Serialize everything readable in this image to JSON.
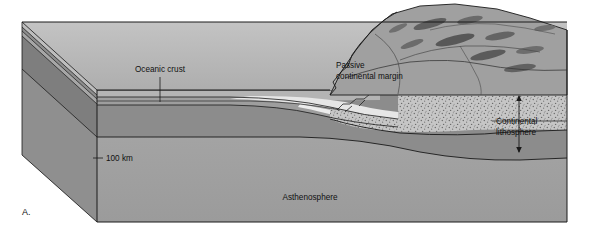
{
  "figure": {
    "panel_label": "A.",
    "type": "block-diagram"
  },
  "labels": {
    "oceanic_crust": "Oceanic crust",
    "passive_margin_line1": "Passive",
    "passive_margin_line2": "continental margin",
    "continental_lithosphere_line1": "Continental",
    "continental_lithosphere_line2": "lithosphere",
    "asthenosphere": "Asthenosphere",
    "depth_scale": "100 km"
  },
  "colors": {
    "background": "#ffffff",
    "sky_top_face": "#b9b9b9",
    "left_side_face": "#8f8f8f",
    "asthenosphere": "#a2a2a2",
    "mantle_lithosphere": "#8c8c8c",
    "continental_crust_stipple": "#c4c4c4",
    "oceanic_crust": "#9e9e9e",
    "sediment_wedge": "#e4e4e4",
    "water": "#b4b4b4",
    "mountain_terrain": "#9a9a9a",
    "mountain_shadow": "#565656",
    "outline": "#1a1a1a",
    "text": "#111111"
  },
  "geology": {
    "layers": [
      "water",
      "oceanic crust",
      "sediment wedge",
      "continental crust",
      "mantle lithosphere",
      "asthenosphere"
    ],
    "features": [
      "stair-step normal faults at margin",
      "thickening sediment wedge",
      "lithosphere-asthenosphere boundary at 100 km",
      "continental mountain topography"
    ]
  }
}
